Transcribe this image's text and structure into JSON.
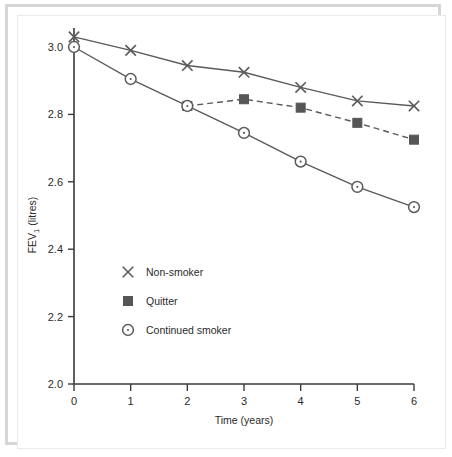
{
  "figure": {
    "background_color": "#ffffff",
    "frame_color": "#d6d6d6",
    "axis_color": "#3a3a3a",
    "series_color_nonsmoker": "#5a5a5a",
    "series_color_quitter": "#5a5a5a",
    "series_color_smoker": "#5a5a5a",
    "marker_fill_quitter": "#565656"
  },
  "chart_data": {
    "type": "line",
    "title": "",
    "subtitle": "",
    "xlabel": "Time (years)",
    "ylabel": "FEV",
    "ylabel_subscript": "1",
    "ylabel_units": " (litres)",
    "ylabel_full": "FEV₁ (litres)",
    "x": [
      0,
      1,
      2,
      3,
      4,
      5,
      6
    ],
    "xticklabels": [
      "0",
      "1",
      "2",
      "3",
      "4",
      "5",
      "6"
    ],
    "yticklabels": [
      "2.0",
      "2.2",
      "2.4",
      "2.6",
      "2.8",
      "3.0"
    ],
    "yticks": [
      2.0,
      2.2,
      2.4,
      2.6,
      2.8,
      3.0
    ],
    "xlim": [
      0,
      6
    ],
    "ylim": [
      2.0,
      3.0
    ],
    "grid": false,
    "legend_position": "inside-lower-left",
    "series": [
      {
        "name": "Non-smoker",
        "marker": "x",
        "linestyle": "solid",
        "x": [
          0,
          1,
          2,
          3,
          4,
          5,
          6
        ],
        "values": [
          3.03,
          2.99,
          2.945,
          2.925,
          2.88,
          2.84,
          2.825
        ]
      },
      {
        "name": "Quitter",
        "marker": "square",
        "linestyle": "dashed",
        "x": [
          2,
          3,
          4,
          5,
          6
        ],
        "values": [
          2.825,
          2.845,
          2.82,
          2.775,
          2.725
        ]
      },
      {
        "name": "Continued smoker",
        "marker": "circle-dot",
        "linestyle": "solid",
        "x": [
          0,
          1,
          2,
          3,
          4,
          5,
          6
        ],
        "values": [
          3.0,
          2.905,
          2.825,
          2.745,
          2.66,
          2.585,
          2.525
        ]
      }
    ],
    "legend": [
      {
        "label": "Non-smoker",
        "marker": "x"
      },
      {
        "label": "Quitter",
        "marker": "square"
      },
      {
        "label": "Continued smoker",
        "marker": "circle-dot"
      }
    ]
  }
}
